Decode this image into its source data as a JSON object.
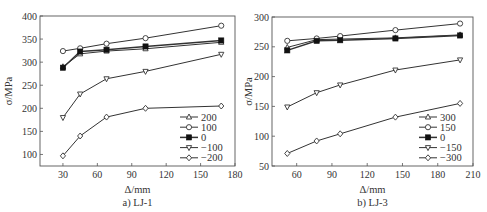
{
  "chart_data": [
    {
      "type": "line",
      "caption": "a) LJ-1",
      "xlabel": "Δ/mm",
      "ylabel": "σ/MPa",
      "xlim": [
        10,
        180
      ],
      "ylim": [
        75,
        400
      ],
      "xticks": [
        30,
        60,
        90,
        120,
        150,
        180
      ],
      "yticks": [
        100,
        150,
        200,
        250,
        300,
        350,
        400
      ],
      "grid": false,
      "legend_position": "lower right",
      "x": [
        30,
        45,
        68,
        102,
        168
      ],
      "series": [
        {
          "name": "200",
          "marker": "triangle-up",
          "values": [
            290,
            318,
            324,
            329,
            343
          ]
        },
        {
          "name": "100",
          "marker": "circle",
          "values": [
            324,
            330,
            340,
            352,
            379
          ]
        },
        {
          "name": "0",
          "marker": "square-filled",
          "values": [
            288,
            323,
            327,
            334,
            347
          ]
        },
        {
          "name": "-100",
          "marker": "triangle-down",
          "values": [
            180,
            231,
            264,
            280,
            317
          ]
        },
        {
          "name": "-200",
          "marker": "diamond",
          "values": [
            97,
            140,
            181,
            200,
            205
          ]
        }
      ]
    },
    {
      "type": "line",
      "caption": "b) LJ-3",
      "xlabel": "Δ/mm",
      "ylabel": "σ/MPa",
      "xlim": [
        39,
        210
      ],
      "ylim": [
        50,
        300
      ],
      "xticks": [
        60,
        90,
        120,
        150,
        180,
        210
      ],
      "yticks": [
        50,
        100,
        150,
        200,
        250,
        300
      ],
      "grid": false,
      "legend_position": "lower right",
      "x": [
        52,
        77,
        97,
        144,
        199
      ],
      "series": [
        {
          "name": "300",
          "marker": "triangle-up",
          "values": [
            249,
            262,
            263,
            265,
            270
          ]
        },
        {
          "name": "150",
          "marker": "circle",
          "values": [
            260,
            264,
            268,
            278,
            289
          ]
        },
        {
          "name": "0",
          "marker": "square-filled",
          "values": [
            244,
            260,
            261,
            264,
            269
          ]
        },
        {
          "name": "-150",
          "marker": "triangle-down",
          "values": [
            149,
            173,
            186,
            211,
            228
          ]
        },
        {
          "name": "-300",
          "marker": "diamond",
          "values": [
            71,
            92,
            104,
            132,
            155
          ]
        }
      ]
    }
  ],
  "colors": {
    "line": "#333333",
    "axis": "#555555",
    "marker_fill": "#ffffff",
    "marker_fill_solid": "#111111"
  }
}
